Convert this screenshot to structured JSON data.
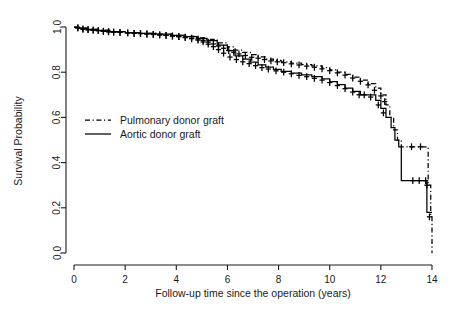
{
  "chart_data": {
    "type": "line",
    "title": "",
    "subtitle": "",
    "xlabel": "Follow-up time since the operation (years)",
    "ylabel": "Survival Probability",
    "xlim": [
      0,
      14
    ],
    "ylim": [
      0,
      1
    ],
    "grid": false,
    "legend_position": "center-left",
    "x_ticks": [
      "0",
      "2",
      "4",
      "6",
      "8",
      "10",
      "12",
      "14"
    ],
    "x_tick_values": [
      0,
      2,
      4,
      6,
      8,
      10,
      12,
      14
    ],
    "y_ticks": [
      "0.0",
      "0.2",
      "0.4",
      "0.6",
      "0.8",
      "1.0"
    ],
    "y_tick_values": [
      0.0,
      0.2,
      0.4,
      0.6,
      0.8,
      1.0
    ],
    "annotations": [],
    "series": [
      {
        "name": "Pulmonary donor graft",
        "style": "dashed",
        "color": "#000000",
        "x": [
          0,
          0.2,
          0.5,
          0.9,
          1.4,
          2.0,
          2.6,
          3.2,
          3.8,
          4.3,
          4.8,
          5.2,
          5.6,
          6.0,
          6.3,
          6.6,
          6.9,
          7.2,
          7.5,
          7.8,
          8.1,
          8.5,
          8.9,
          9.3,
          9.7,
          10.0,
          10.3,
          10.6,
          10.9,
          11.2,
          11.5,
          11.8,
          12.0,
          12.2,
          12.35,
          12.5,
          12.65,
          12.8,
          13.0,
          13.4,
          13.75,
          13.85,
          13.95,
          14.0
        ],
        "values": [
          1.0,
          0.995,
          0.99,
          0.985,
          0.98,
          0.975,
          0.972,
          0.968,
          0.963,
          0.958,
          0.952,
          0.945,
          0.93,
          0.912,
          0.898,
          0.888,
          0.878,
          0.868,
          0.858,
          0.852,
          0.846,
          0.84,
          0.834,
          0.828,
          0.82,
          0.81,
          0.8,
          0.79,
          0.778,
          0.765,
          0.75,
          0.73,
          0.7,
          0.655,
          0.6,
          0.545,
          0.5,
          0.47,
          0.47,
          0.47,
          0.47,
          0.3,
          0.16,
          0.0
        ],
        "censor_x": [
          0.15,
          0.35,
          0.55,
          0.75,
          0.95,
          1.15,
          1.35,
          1.55,
          1.8,
          2.1,
          2.35,
          2.6,
          2.85,
          3.1,
          3.35,
          3.6,
          3.85,
          4.1,
          4.35,
          4.6,
          4.85,
          5.05,
          5.25,
          5.45,
          5.65,
          5.85,
          6.05,
          6.25,
          6.45,
          6.7,
          6.95,
          7.2,
          7.45,
          7.7,
          7.95,
          8.2,
          8.5,
          8.8,
          9.1,
          9.4,
          9.7,
          10.0,
          10.3,
          10.6,
          10.9,
          11.2,
          11.5,
          11.75,
          12.0,
          12.15,
          13.2,
          13.55,
          13.8,
          13.9
        ],
        "censor_y": [
          0.996,
          0.991,
          0.988,
          0.986,
          0.984,
          0.981,
          0.979,
          0.977,
          0.976,
          0.974,
          0.972,
          0.971,
          0.969,
          0.967,
          0.965,
          0.963,
          0.96,
          0.958,
          0.955,
          0.951,
          0.947,
          0.941,
          0.933,
          0.925,
          0.916,
          0.906,
          0.896,
          0.888,
          0.881,
          0.874,
          0.866,
          0.862,
          0.856,
          0.85,
          0.846,
          0.842,
          0.837,
          0.832,
          0.827,
          0.822,
          0.815,
          0.807,
          0.797,
          0.787,
          0.774,
          0.76,
          0.744,
          0.72,
          0.695,
          0.67,
          0.47,
          0.47,
          0.3,
          0.16
        ]
      },
      {
        "name": "Aortic donor graft",
        "style": "solid",
        "color": "#000000",
        "x": [
          0,
          0.2,
          0.5,
          0.9,
          1.4,
          2.0,
          2.6,
          3.2,
          3.8,
          4.3,
          4.8,
          5.2,
          5.6,
          6.0,
          6.3,
          6.6,
          6.9,
          7.2,
          7.5,
          7.8,
          8.1,
          8.5,
          8.9,
          9.3,
          9.7,
          10.0,
          10.3,
          10.6,
          10.9,
          11.2,
          11.5,
          11.8,
          12.0,
          12.2,
          12.4,
          12.55,
          12.7,
          12.8,
          13.1,
          13.6,
          13.8,
          13.9,
          14.0
        ],
        "values": [
          1.0,
          0.995,
          0.99,
          0.985,
          0.98,
          0.975,
          0.972,
          0.968,
          0.963,
          0.957,
          0.95,
          0.94,
          0.92,
          0.895,
          0.872,
          0.858,
          0.845,
          0.832,
          0.822,
          0.812,
          0.804,
          0.796,
          0.788,
          0.78,
          0.77,
          0.758,
          0.745,
          0.73,
          0.715,
          0.7,
          0.7,
          0.675,
          0.64,
          0.6,
          0.555,
          0.5,
          0.47,
          0.32,
          0.32,
          0.32,
          0.18,
          0.18,
          0.18
        ],
        "censor_x": [
          0.15,
          0.35,
          0.55,
          0.75,
          0.95,
          1.15,
          1.35,
          1.55,
          1.8,
          2.1,
          2.35,
          2.6,
          2.85,
          3.1,
          3.35,
          3.6,
          3.85,
          4.1,
          4.35,
          4.6,
          4.85,
          5.05,
          5.25,
          5.45,
          5.65,
          5.85,
          6.1,
          6.35,
          6.6,
          6.85,
          7.1,
          7.35,
          7.6,
          7.9,
          8.2,
          8.5,
          8.8,
          9.1,
          9.4,
          9.7,
          10.0,
          10.3,
          10.6,
          10.9,
          11.15,
          11.35,
          11.6,
          11.9,
          12.1,
          13.25,
          13.5,
          13.75
        ],
        "censor_y": [
          0.996,
          0.991,
          0.988,
          0.986,
          0.984,
          0.981,
          0.979,
          0.977,
          0.976,
          0.974,
          0.972,
          0.971,
          0.969,
          0.967,
          0.965,
          0.963,
          0.96,
          0.957,
          0.953,
          0.948,
          0.942,
          0.934,
          0.924,
          0.913,
          0.9,
          0.884,
          0.867,
          0.856,
          0.846,
          0.838,
          0.829,
          0.82,
          0.814,
          0.806,
          0.8,
          0.793,
          0.786,
          0.78,
          0.773,
          0.765,
          0.754,
          0.741,
          0.727,
          0.712,
          0.7,
          0.7,
          0.69,
          0.655,
          0.62,
          0.32,
          0.32,
          0.32
        ]
      }
    ]
  },
  "legend": {
    "items": [
      {
        "label": "Pulmonary donor graft",
        "style": "dashed"
      },
      {
        "label": "Aortic donor graft",
        "style": "solid"
      }
    ]
  }
}
